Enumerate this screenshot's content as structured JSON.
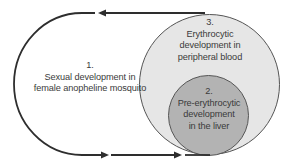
{
  "diagram": {
    "colors": {
      "line": "#2e2e2e",
      "outer_circle_fill": "#e6e6e6",
      "outer_circle_stroke": "#555555",
      "inner_circle_fill": "#b3b3b3",
      "inner_circle_stroke": "#555555",
      "text": "#3a3a3a"
    },
    "stages": [
      {
        "number": "1.",
        "lines": [
          "Sexual development in",
          "female anopheline mosquito"
        ]
      },
      {
        "number": "2.",
        "lines": [
          "Pre-erythrocytic",
          "development",
          "in the liver"
        ]
      },
      {
        "number": "3.",
        "lines": [
          "Erythrocytic",
          "development in",
          "peripheral blood"
        ]
      }
    ],
    "arrows": [
      {
        "direction": "left",
        "position": "top"
      },
      {
        "direction": "right",
        "position": "bottom-1"
      },
      {
        "direction": "right",
        "position": "bottom-2"
      }
    ]
  }
}
